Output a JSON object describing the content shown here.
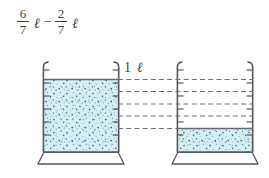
{
  "equation": {
    "term1": {
      "numerator": "6",
      "denominator": "7",
      "unit": "ℓ"
    },
    "operator": "−",
    "term2": {
      "numerator": "2",
      "denominator": "7",
      "unit": "ℓ"
    },
    "full_text": "6/7 ℓ − 2/7 ℓ"
  },
  "figure": {
    "capacity_label": "1 ℓ",
    "colors": {
      "liquid_fill": "#d3eef5",
      "liquid_edge": "#5f6a6e",
      "speckle": "#2f4858",
      "glass_outline": "#55595c",
      "dash_line": "#6b6f72",
      "ink": "#3b3b3b",
      "page_background": "#ffffff"
    },
    "beakers": [
      {
        "name": "left-beaker",
        "fill_fraction": "6/7",
        "fill_level_label": "6/7 ℓ",
        "graduation_ticks": 6
      },
      {
        "name": "right-beaker",
        "fill_fraction": "2/7",
        "fill_level_label": "2/7 ℓ",
        "graduation_ticks": 6
      }
    ],
    "connector_dashed_lines": 5
  }
}
